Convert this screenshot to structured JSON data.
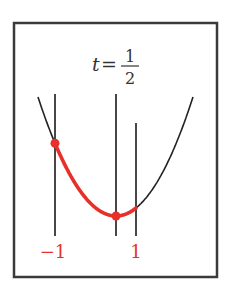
{
  "title": {
    "variable": "t",
    "equals": "=",
    "numerator": "1",
    "denominator": "2"
  },
  "labels": {
    "left": "−1",
    "right": "1"
  },
  "colors": {
    "frame": "#3a3a3a",
    "line": "#333333",
    "curve": "#222222",
    "highlight": "#e8302a",
    "background": "#ffffff"
  },
  "geometry": {
    "frame": {
      "x": 14,
      "y": 23,
      "w": 203,
      "h": 254
    },
    "vlines": [
      {
        "name": "left-line",
        "x": 55,
        "y1": 94,
        "y2": 236
      },
      {
        "name": "middle-line",
        "x": 116,
        "y1": 94,
        "y2": 236
      },
      {
        "name": "right-line",
        "x": 136,
        "y1": 123,
        "y2": 236
      }
    ],
    "parabola": {
      "x_start": 38,
      "x_end": 193,
      "y_top": 97,
      "vertex_x": 116,
      "vertex_y": 216
    },
    "highlight_range": {
      "x_start": 55,
      "x_end": 136
    },
    "points": [
      {
        "name": "left-point",
        "x": 55
      },
      {
        "name": "middle-point",
        "x": 116
      }
    ]
  }
}
